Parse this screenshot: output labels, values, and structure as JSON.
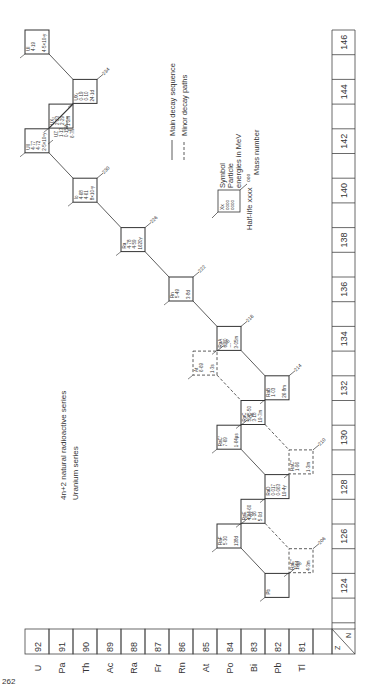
{
  "title": {
    "line1": "4n+2 natural radioactive series",
    "line2": "Uranium series"
  },
  "legend": {
    "main": "Main decay sequence",
    "minor": "Minor decay paths",
    "key_symbol": "Xx",
    "key_energy": "oooo",
    "key_halflife_label": "Half-life",
    "key_halflife": "xxxx",
    "key_mass": "ooo",
    "label_symbol": "Symbol",
    "label_particle": "Particle",
    "label_energies": "energies in MeV",
    "label_mass": "Mass number"
  },
  "z_axis": {
    "corner_z": "Z",
    "corner_n": "N",
    "values": [
      "92",
      "91",
      "90",
      "89",
      "88",
      "87",
      "86",
      "85",
      "84",
      "83",
      "82",
      "81"
    ],
    "symbols": [
      "U",
      "Pa",
      "Th",
      "Ac",
      "Ra",
      "Fr",
      "Rn",
      "At",
      "Po",
      "Bi",
      "Pb",
      "Tl"
    ]
  },
  "n_axis": {
    "values": [
      "124",
      "",
      "126",
      "",
      "128",
      "",
      "130",
      "",
      "132",
      "",
      "134",
      "",
      "136",
      "",
      "138",
      "",
      "140",
      "",
      "142",
      "",
      "144",
      "",
      "146"
    ]
  },
  "nuclides": [
    {
      "id": "UI",
      "symbol": "UI",
      "Z": 92,
      "N": 146,
      "energies": [
        "4·19"
      ],
      "halflife": "4·5×10⁹y",
      "mass": "",
      "dashed": false
    },
    {
      "id": "UX1",
      "symbol": "UX₁",
      "Z": 90,
      "N": 144,
      "energies": [
        "0·19",
        "0·10"
      ],
      "halflife": "24·1d",
      "mass": "234",
      "dashed": false
    },
    {
      "id": "UX2",
      "symbol": "UX₂",
      "Z": 91,
      "N": 143,
      "energies": [
        "2·23",
        "2·29"
      ],
      "halflife": "1·2m",
      "mass": "",
      "dashed": false
    },
    {
      "id": "UZ",
      "symbol": "UZ",
      "Z": 91,
      "N": 143,
      "energies": [
        "1·13",
        "0·15%"
      ],
      "halflife": "6·7h",
      "mass": "",
      "dashed": true
    },
    {
      "id": "UII",
      "symbol": "UII",
      "Z": 92,
      "N": 142,
      "energies": [
        "4·77",
        "4·72"
      ],
      "halflife": "2·5×10⁵y",
      "mass": "",
      "dashed": false
    },
    {
      "id": "Io",
      "symbol": "Io",
      "Z": 90,
      "N": 140,
      "energies": [
        "4·68",
        "4·61"
      ],
      "halflife": "8×10⁴y",
      "mass": "230",
      "dashed": false
    },
    {
      "id": "Ra",
      "symbol": "Ra",
      "Z": 88,
      "N": 138,
      "energies": [
        "4·78",
        "4·59"
      ],
      "halflife": "1620y",
      "mass": "226",
      "dashed": false
    },
    {
      "id": "Rn",
      "symbol": "Rn",
      "Z": 86,
      "N": 136,
      "energies": [
        "5·49"
      ],
      "halflife": "3·8d",
      "mass": "222",
      "dashed": false
    },
    {
      "id": "RaA",
      "symbol": "RaA",
      "Z": 84,
      "N": 134,
      "energies": [
        "6·00",
        "---"
      ],
      "halflife": "3·05m",
      "mass": "218",
      "dashed": false
    },
    {
      "id": "At",
      "symbol": "At",
      "Z": 85,
      "N": 133,
      "energies": [
        "6·69"
      ],
      "halflife": "1·3s",
      "mass": "218",
      "dashed": true
    },
    {
      "id": "RaB",
      "symbol": "RaB",
      "Z": 82,
      "N": 132,
      "energies": [
        "1·03"
      ],
      "halflife": "26·8m",
      "mass": "214",
      "dashed": false
    },
    {
      "id": "RaC",
      "symbol": "RaC",
      "Z": 83,
      "N": 131,
      "energies": [
        "5·45·50",
        "3·18"
      ],
      "halflife": "19·7m",
      "mass": "",
      "dashed": false
    },
    {
      "id": "RaC1",
      "symbol": "RaC′",
      "Z": 84,
      "N": 130,
      "energies": [
        "7·69"
      ],
      "halflife": "1·64μs",
      "mass": "214",
      "dashed": false
    },
    {
      "id": "RaC2",
      "symbol": "RaC″",
      "Z": 81,
      "N": 129,
      "energies": [
        "1·96"
      ],
      "halflife": "1·3m",
      "mass": "210",
      "dashed": true
    },
    {
      "id": "RaD",
      "symbol": "RaD",
      "Z": 82,
      "N": 128,
      "energies": [
        "0·017",
        "0·063"
      ],
      "halflife": "19·4y",
      "mass": "",
      "dashed": false
    },
    {
      "id": "RaE",
      "symbol": "RaE",
      "Z": 83,
      "N": 127,
      "energies": [
        "4·94·60",
        "1·16"
      ],
      "halflife": "5·0d",
      "mass": "",
      "dashed": false
    },
    {
      "id": "RaF",
      "symbol": "RaF",
      "Z": 84,
      "N": 126,
      "energies": [
        "5·30"
      ],
      "halflife": "138d",
      "mass": "210",
      "dashed": false
    },
    {
      "id": "RaE2",
      "symbol": "RaE″",
      "Z": 81,
      "N": 125,
      "energies": [
        "1·44"
      ],
      "halflife": "4·3m",
      "mass": "206",
      "dashed": true
    },
    {
      "id": "Pb",
      "symbol": "Pb",
      "Z": 82,
      "N": 124,
      "energies": [],
      "halflife": "",
      "mass": "206",
      "dashed": false
    }
  ],
  "branch_labels": {
    "RaA": [
      "α",
      "β"
    ],
    "RaC": [
      "α",
      "β"
    ],
    "RaE": [
      "α",
      "β"
    ]
  },
  "page_number": "262"
}
